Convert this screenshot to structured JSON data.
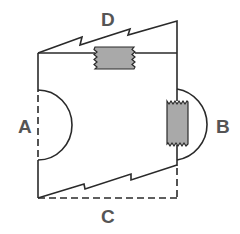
{
  "diagram": {
    "type": "mechanical-cut-diagram",
    "labels": {
      "top": "D",
      "left": "A",
      "right": "B",
      "bottom": "C"
    },
    "colors": {
      "line": "#2a2a2a",
      "block_fill": "#a9a9a9",
      "label": "#555555",
      "background": "#ffffff"
    },
    "elements": [
      {
        "id": "D",
        "description": "zigzag break line above top edge, with gray rectangular block on top edge"
      },
      {
        "id": "A",
        "description": "semicircle on left edge, left edge dashed inside"
      },
      {
        "id": "B",
        "description": "semicircle on right edge with vertical gray block"
      },
      {
        "id": "C",
        "description": "zigzag break line above dashed bottom edge"
      }
    ]
  }
}
